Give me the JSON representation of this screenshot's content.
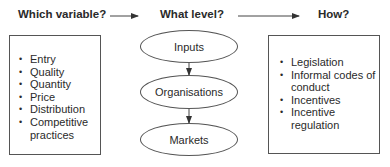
{
  "headers": {
    "variable": "Which variable?",
    "level": "What level?",
    "how": "How?"
  },
  "variables": {
    "items": [
      "Entry",
      "Quality",
      "Quantity",
      "Price",
      "Distribution",
      "Competitive practices"
    ]
  },
  "levels": {
    "items": [
      "Inputs",
      "Organisations",
      "Markets"
    ]
  },
  "methods": {
    "items": [
      "Legislation",
      "Informal codes of conduct",
      "Incentives",
      "Incentive regulation"
    ]
  },
  "colors": {
    "line": "#555555",
    "text": "#2a2a2a"
  }
}
